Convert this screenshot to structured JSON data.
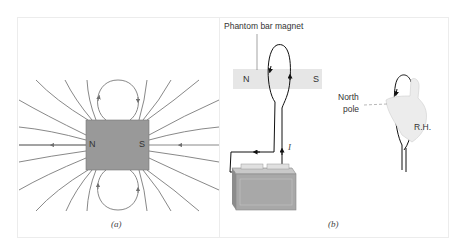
{
  "panel_a": {
    "caption": "(a)",
    "magnet": {
      "north_label": "N",
      "south_label": "S",
      "fill": "#999999"
    },
    "field_line_color": "#7a7a7a",
    "field_line_count": 16
  },
  "panel_b": {
    "caption": "(b)",
    "phantom_magnet_label": "Phantom bar magnet",
    "phantom_magnet": {
      "north_label": "N",
      "south_label": "S",
      "fill": "#e6e6e6"
    },
    "current_label": "I",
    "north_pole_label_line1": "North",
    "north_pole_label_line2": "pole",
    "right_hand_label": "R.H.",
    "battery_fill": "#a8a8a8"
  }
}
